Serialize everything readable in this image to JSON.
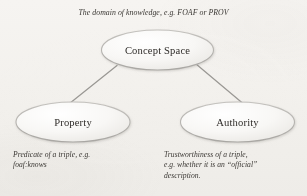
{
  "diagram": {
    "title_caption": "The domain of knowledge, e.g. FOAF or PROV",
    "nodes": [
      {
        "id": "concept-space",
        "label": "Concept Space",
        "cx": 157.5,
        "cy": 50,
        "rx": 56,
        "ry": 20
      },
      {
        "id": "property",
        "label": "Property",
        "cx": 73,
        "cy": 122,
        "rx": 57,
        "ry": 20
      },
      {
        "id": "authority",
        "label": "Authority",
        "cx": 237.5,
        "cy": 122,
        "rx": 57,
        "ry": 20
      }
    ],
    "edges": [
      {
        "id": "edge-concept-property",
        "from": "concept-space",
        "to": "property"
      },
      {
        "id": "edge-concept-authority",
        "from": "concept-space",
        "to": "authority"
      }
    ],
    "annotations": {
      "property_note": "Predicate of a triple, e.g.\nfoaf:knows",
      "authority_note": "Trustworthiness of a triple,\ne.g. whether it is an “official”\ndescription."
    },
    "colors": {
      "page_background": "#f3f1ee",
      "node_fill": "#f7f6f4",
      "node_stroke": "#b8b6b2",
      "edge_stroke": "#9a9894",
      "text": "#2f2c29",
      "caption_text": "#3a3733"
    }
  }
}
